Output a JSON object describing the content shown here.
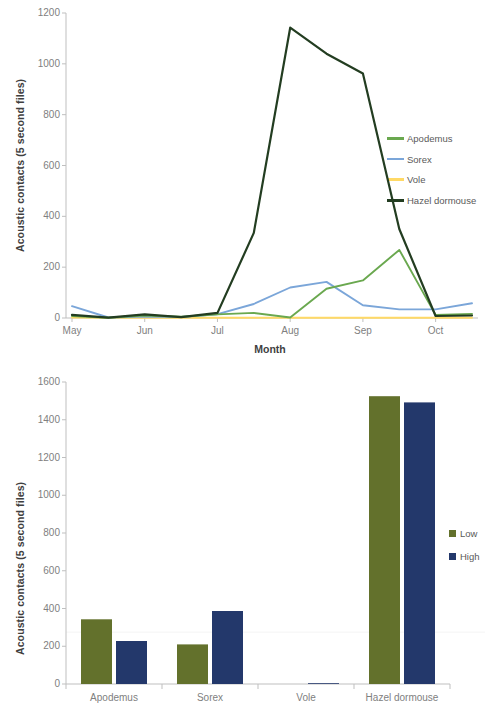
{
  "chart_data": [
    {
      "type": "line",
      "title": "",
      "xlabel": "Month",
      "ylabel": "Acoustic contacts (5 second files)",
      "ylim": [
        0,
        1200
      ],
      "ytick_labels": [
        "1200",
        "1000",
        "800",
        "600",
        "400",
        "200",
        "0"
      ],
      "yticks": [
        1200,
        1000,
        800,
        600,
        400,
        200,
        0
      ],
      "xtick_labels": [
        "May",
        "Jun",
        "Jul",
        "Aug",
        "Sep",
        "Oct"
      ],
      "x": [
        0,
        1,
        2,
        3,
        4,
        5,
        6,
        7,
        8,
        9,
        10,
        11
      ],
      "grid": false,
      "legend_position": "right",
      "series": [
        {
          "name": "Apodemus",
          "color": "#6aa84f",
          "values": [
            8,
            1,
            10,
            5,
            14,
            20,
            2,
            115,
            148,
            268,
            12,
            16
          ]
        },
        {
          "name": "Sorex",
          "color": "#7ba6d9",
          "values": [
            47,
            2,
            6,
            4,
            15,
            55,
            120,
            142,
            50,
            34,
            34,
            58
          ]
        },
        {
          "name": "Vole",
          "color": "#ffd966",
          "values": [
            2,
            1,
            1,
            1,
            1,
            1,
            1,
            1,
            1,
            1,
            1,
            1
          ]
        },
        {
          "name": "Hazel dormouse",
          "color": "#233d21",
          "values": [
            12,
            1,
            14,
            3,
            20,
            335,
            1142,
            1040,
            962,
            350,
            8,
            10
          ]
        }
      ]
    },
    {
      "type": "bar",
      "title": "",
      "xlabel": "",
      "ylabel": "Acoustic contacts (5 second files)",
      "ylim": [
        0,
        1600
      ],
      "ytick_labels": [
        "1600",
        "1400",
        "1200",
        "1000",
        "800",
        "600",
        "400",
        "200",
        "0"
      ],
      "yticks": [
        1600,
        1400,
        1200,
        1000,
        800,
        600,
        400,
        200,
        0
      ],
      "categories": [
        "Apodemus",
        "Sorex",
        "Vole",
        "Hazel dormouse"
      ],
      "grid": false,
      "legend_position": "right",
      "series": [
        {
          "name": "Low",
          "color": "#63712c",
          "values": [
            343,
            210,
            2,
            1525
          ]
        },
        {
          "name": "High",
          "color": "#23386b",
          "values": [
            228,
            387,
            4,
            1492
          ]
        }
      ]
    }
  ],
  "line_chart": {
    "ylabel": "Acoustic contacts (5 second files)",
    "xlabel": "Month",
    "yticks": [
      "1200",
      "1000",
      "800",
      "600",
      "400",
      "200",
      "0"
    ],
    "xticks": [
      "May",
      "Jun",
      "Jul",
      "Aug",
      "Sep",
      "Oct"
    ],
    "legend": [
      {
        "label": "Apodemus",
        "color": "#6aa84f"
      },
      {
        "label": "Sorex",
        "color": "#7ba6d9"
      },
      {
        "label": "Vole",
        "color": "#ffd966"
      },
      {
        "label": "Hazel dormouse",
        "color": "#233d21"
      }
    ]
  },
  "bar_chart": {
    "ylabel": "Acoustic contacts (5 second files)",
    "yticks": [
      "1600",
      "1400",
      "1200",
      "1000",
      "800",
      "600",
      "400",
      "200",
      "0"
    ],
    "categories": [
      "Apodemus",
      "Sorex",
      "Vole",
      "Hazel dormouse"
    ],
    "legend": [
      {
        "label": "Low",
        "color": "#63712c"
      },
      {
        "label": "High",
        "color": "#23386b"
      }
    ]
  }
}
